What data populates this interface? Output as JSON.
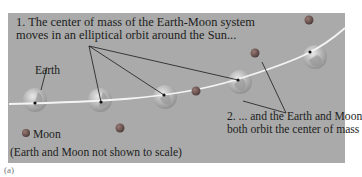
{
  "figure": {
    "label": "(a)",
    "background_color": "#a9aaa9",
    "orbit_color": "#f4f4f4"
  },
  "annotations": {
    "step1_line1": "1. The center of mass of the Earth-Moon system",
    "step1_line2": "moves in an elliptical orbit around the Sun...",
    "step2_line1": "2. ... and the Earth and Moon",
    "step2_line2": "both orbit the center of mass",
    "earth_label": "Earth",
    "moon_label": "Moon",
    "scale_note": "(Earth and Moon not shown to scale)"
  },
  "bodies": {
    "earths": [
      {
        "cx": 35,
        "cy": 100
      },
      {
        "cx": 100,
        "cy": 100
      },
      {
        "cx": 165,
        "cy": 97
      },
      {
        "cx": 240,
        "cy": 82
      },
      {
        "cx": 315,
        "cy": 57
      }
    ],
    "moons": [
      {
        "cx": 120,
        "cy": 128
      },
      {
        "cx": 196,
        "cy": 91
      },
      {
        "cx": 255,
        "cy": 53
      },
      {
        "cx": 309,
        "cy": 20
      }
    ],
    "legend_moon": {
      "cx": 26,
      "cy": 133
    }
  }
}
